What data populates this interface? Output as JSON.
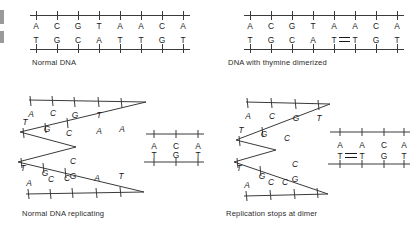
{
  "figure": {
    "background_color": "#ffffff",
    "line_color": "#3a3a3a",
    "text_color": "#1a1a1a"
  },
  "panels": [
    {
      "id": "normal-dna",
      "caption": "Normal DNA",
      "type": "duplex",
      "top_strand": [
        "A",
        "C",
        "G",
        "T",
        "A",
        "A",
        "C",
        "A"
      ],
      "bottom_strand": [
        "T",
        "G",
        "C",
        "A",
        "T",
        "T",
        "G",
        "T"
      ],
      "dimer": null
    },
    {
      "id": "dimerized-dna",
      "caption": "DNA with thymine dimerized",
      "type": "duplex",
      "top_strand": [
        "A",
        "C",
        "G",
        "T",
        "A",
        "A",
        "C",
        "A"
      ],
      "bottom_strand": [
        "T",
        "G",
        "C",
        "A",
        "T",
        "T",
        "G",
        "T"
      ],
      "dimer": {
        "between": [
          4,
          5
        ],
        "bases": [
          "T",
          "T"
        ],
        "bond": "double"
      }
    },
    {
      "id": "normal-replicating",
      "caption": "Normal DNA replicating",
      "type": "fork",
      "upper_arm": {
        "inner_strand": [
          "A",
          "C",
          "G",
          "T",
          "A",
          "A"
        ],
        "outer_strand": [
          "T",
          "G",
          "C"
        ]
      },
      "lower_arm": {
        "inner_strand": [
          "A",
          "C",
          "G",
          "C",
          "A",
          "T"
        ],
        "outer_strand": [
          "T",
          "G",
          "C"
        ]
      },
      "duplex_top": [
        "A",
        "C",
        "A"
      ],
      "duplex_bottom": [
        "T",
        "G",
        "T"
      ],
      "dimer": null
    },
    {
      "id": "replication-stops",
      "caption": "Replication stops at dimer",
      "type": "fork",
      "upper_arm": {
        "inner_strand": [
          "A",
          "C",
          "G",
          "T"
        ],
        "outer_strand": [
          "T",
          "G",
          "C"
        ]
      },
      "lower_arm": {
        "inner_strand": [
          "A",
          "C",
          "G",
          "C"
        ],
        "outer_strand": [
          "T",
          "G",
          "C"
        ]
      },
      "duplex_top": [
        "A",
        "A",
        "C",
        "A"
      ],
      "duplex_bottom": [
        "T",
        "T",
        "G",
        "T"
      ],
      "dimer": {
        "between": [
          0,
          1
        ],
        "bases": [
          "T",
          "T"
        ],
        "bond": "double"
      }
    }
  ]
}
